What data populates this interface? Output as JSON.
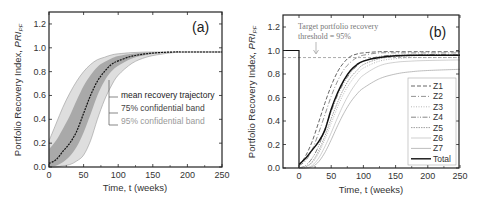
{
  "chart_data": [
    {
      "id": "a",
      "type": "area",
      "panel_label": "(a)",
      "xlabel": "Time, t (weeks)",
      "ylabel": "Portfolio Recovery Index, PRI_PF",
      "xlim": [
        0,
        250
      ],
      "ylim": [
        0,
        1.3
      ],
      "xticks": [
        0,
        50,
        100,
        150,
        200,
        250
      ],
      "yticks": [
        0.0,
        0.2,
        0.4,
        0.6,
        0.8,
        1.0,
        1.2
      ],
      "grid": false,
      "legend_entries": [
        "mean recovery trajectory",
        "75% confidential band",
        "95% confidential band"
      ],
      "x": [
        0,
        10,
        20,
        30,
        40,
        50,
        60,
        70,
        80,
        90,
        100,
        120,
        140,
        160,
        180,
        200,
        250
      ],
      "series": [
        {
          "name": "mean recovery trajectory",
          "values": [
            0.03,
            0.06,
            0.13,
            0.2,
            0.3,
            0.45,
            0.6,
            0.72,
            0.8,
            0.86,
            0.89,
            0.93,
            0.95,
            0.96,
            0.965,
            0.965,
            0.965
          ]
        },
        {
          "name": "75% confidential band upper",
          "values": [
            0.15,
            0.22,
            0.32,
            0.43,
            0.56,
            0.68,
            0.77,
            0.84,
            0.88,
            0.91,
            0.93,
            0.95,
            0.96,
            0.965,
            0.965,
            0.965,
            0.965
          ]
        },
        {
          "name": "75% confidential band lower",
          "values": [
            0.0,
            0.01,
            0.04,
            0.09,
            0.17,
            0.29,
            0.44,
            0.6,
            0.72,
            0.8,
            0.85,
            0.91,
            0.94,
            0.955,
            0.965,
            0.965,
            0.965
          ]
        },
        {
          "name": "95% confidential band upper",
          "values": [
            0.22,
            0.36,
            0.5,
            0.62,
            0.72,
            0.8,
            0.86,
            0.9,
            0.92,
            0.94,
            0.95,
            0.96,
            0.965,
            0.965,
            0.965,
            0.965,
            0.965
          ]
        },
        {
          "name": "95% confidential band lower",
          "values": [
            0.0,
            0.0,
            0.01,
            0.02,
            0.05,
            0.1,
            0.22,
            0.4,
            0.56,
            0.68,
            0.77,
            0.87,
            0.92,
            0.945,
            0.96,
            0.965,
            0.965
          ]
        }
      ]
    },
    {
      "id": "b",
      "type": "line",
      "panel_label": "(b)",
      "xlabel": "Time, t (weeks)",
      "ylabel": "Portfolio Recovery Index, PRI_PF",
      "xlim": [
        -25,
        250
      ],
      "ylim": [
        0,
        1.3
      ],
      "xticks": [
        0,
        50,
        100,
        150,
        200,
        250
      ],
      "yticks": [
        0.0,
        0.2,
        0.4,
        0.6,
        0.8,
        1.0,
        1.2
      ],
      "grid": false,
      "legend_position": "lower right",
      "annotation": "Target portfolio recovery threshold = 95%",
      "threshold": 0.94,
      "x": [
        0,
        10,
        20,
        30,
        40,
        50,
        60,
        70,
        80,
        90,
        100,
        125,
        150,
        175,
        200,
        250
      ],
      "series": [
        {
          "name": "Z1",
          "values": [
            0.02,
            0.1,
            0.22,
            0.38,
            0.55,
            0.7,
            0.82,
            0.9,
            0.95,
            0.97,
            0.98,
            0.99,
            0.99,
            0.99,
            0.99,
            0.99
          ]
        },
        {
          "name": "Z2",
          "values": [
            0.02,
            0.06,
            0.15,
            0.29,
            0.45,
            0.61,
            0.74,
            0.84,
            0.9,
            0.94,
            0.96,
            0.98,
            0.98,
            0.98,
            0.98,
            0.98
          ]
        },
        {
          "name": "Z3",
          "values": [
            0.0,
            0.01,
            0.04,
            0.12,
            0.24,
            0.38,
            0.52,
            0.64,
            0.73,
            0.8,
            0.85,
            0.91,
            0.93,
            0.94,
            0.94,
            0.94
          ]
        },
        {
          "name": "Z4",
          "values": [
            0.0,
            0.02,
            0.08,
            0.18,
            0.33,
            0.48,
            0.62,
            0.73,
            0.81,
            0.87,
            0.91,
            0.95,
            0.96,
            0.96,
            0.965,
            0.965
          ]
        },
        {
          "name": "Z5",
          "values": [
            0.0,
            0.01,
            0.05,
            0.14,
            0.27,
            0.42,
            0.56,
            0.68,
            0.77,
            0.83,
            0.88,
            0.93,
            0.95,
            0.955,
            0.96,
            0.96
          ]
        },
        {
          "name": "Z6",
          "values": [
            0.0,
            0.0,
            0.02,
            0.08,
            0.18,
            0.3,
            0.43,
            0.55,
            0.65,
            0.73,
            0.79,
            0.87,
            0.9,
            0.91,
            0.915,
            0.92
          ]
        },
        {
          "name": "Z7",
          "values": [
            0.0,
            0.0,
            0.01,
            0.05,
            0.13,
            0.24,
            0.36,
            0.47,
            0.56,
            0.63,
            0.68,
            0.76,
            0.8,
            0.82,
            0.83,
            0.84
          ]
        },
        {
          "name": "Total",
          "values": [
            0.03,
            0.08,
            0.15,
            0.22,
            0.32,
            0.5,
            0.64,
            0.75,
            0.83,
            0.88,
            0.91,
            0.94,
            0.955,
            0.96,
            0.96,
            0.96
          ]
        }
      ],
      "pre_event": {
        "x": [
          -25,
          0
        ],
        "value": 1.0
      }
    }
  ],
  "labels": {
    "panel_a": "(a)",
    "panel_b": "(b)",
    "xlabel": "Time, t (weeks)",
    "ylabel_main": "Portfolio Recovery Index, ",
    "ylabel_sym": "PRI",
    "ylabel_sub": "PF",
    "legend_a": [
      "mean recovery trajectory",
      "75% confidential band",
      "95% confidential band"
    ],
    "legend_b": [
      "Z1",
      "Z2",
      "Z3",
      "Z4",
      "Z5",
      "Z6",
      "Z7",
      "Total"
    ],
    "annotation_line1": "Target portfolio recovery",
    "annotation_line2": "threshold = 95%",
    "xticks": [
      "0",
      "50",
      "100",
      "150",
      "200",
      "250"
    ],
    "yticks": [
      "0.0",
      "0.2",
      "0.4",
      "0.6",
      "0.8",
      "1.0",
      "1.2"
    ]
  },
  "colors": {
    "mean": "#111111",
    "band75": "#a9a9a9",
    "band95": "#dedede",
    "total": "#111111",
    "zones": [
      "#555555",
      "#777777",
      "#9a9a9a",
      "#666666",
      "#888888",
      "#b0b0b0",
      "#a0a0a0"
    ]
  }
}
